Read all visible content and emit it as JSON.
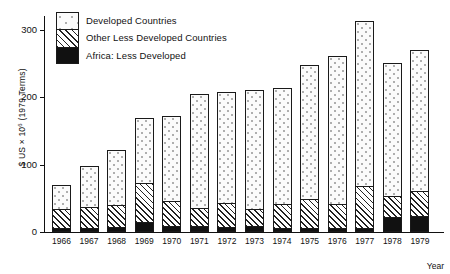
{
  "chart_data": {
    "type": "bar",
    "subtype": "stacked-bar",
    "title": "",
    "xlabel": "Year",
    "ylabel": "$ US × 10⁶ (1979 Terms)",
    "ylabel_prefix": "$ US × 10",
    "ylabel_exponent": "6",
    "ylabel_suffix": " (1979 Terms)",
    "categories": [
      "1966",
      "1967",
      "1968",
      "1969",
      "1970",
      "1971",
      "1972",
      "1973",
      "1974",
      "1975",
      "1976",
      "1977",
      "1978",
      "1979"
    ],
    "yticks": [
      0,
      100,
      200,
      300
    ],
    "ytick_labels": [
      "0",
      "100",
      "200",
      "300"
    ],
    "ylim": [
      0,
      320
    ],
    "grid": false,
    "legend_position": "top-left",
    "series": [
      {
        "name": "Africa: Less Developed",
        "pattern": "solid-black",
        "color": "#111111",
        "values": [
          5,
          5,
          6,
          13,
          8,
          7,
          6,
          8,
          5,
          4,
          4,
          4,
          21,
          23
        ]
      },
      {
        "name": "Other Less Developed Countries",
        "pattern": "diagonal-hatch",
        "color": "#ffffff",
        "values": [
          29,
          31,
          34,
          60,
          37,
          28,
          36,
          25,
          35,
          44,
          36,
          64,
          32,
          37
        ]
      },
      {
        "name": "Developed Countries",
        "pattern": "dotted-stipple",
        "color": "#fbfbfb",
        "values": [
          36,
          62,
          81,
          96,
          127,
          170,
          166,
          178,
          174,
          200,
          221,
          245,
          198,
          210
        ]
      }
    ],
    "totals": [
      70,
      98,
      121,
      169,
      172,
      205,
      208,
      211,
      214,
      248,
      261,
      313,
      251,
      270
    ]
  },
  "legend": {
    "items": [
      {
        "label": "Developed Countries",
        "swatch": "dotted-stipple"
      },
      {
        "label": "Other Less Developed Countries",
        "swatch": "diagonal-hatch"
      },
      {
        "label": "Africa: Less Developed",
        "swatch": "solid-black"
      }
    ]
  }
}
